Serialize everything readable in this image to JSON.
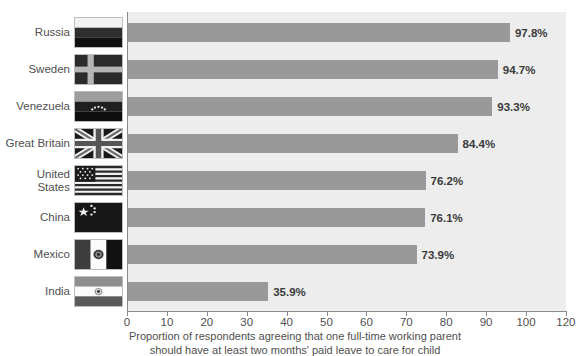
{
  "chart_data": {
    "type": "bar",
    "orientation": "horizontal",
    "title": "",
    "subtitle": "",
    "xlabel": "Proportion of respondents agreeing that one full-time working parent should have at least two months' paid leave to care for child",
    "ylabel": "",
    "categories": [
      "Russia",
      "Sweden",
      "Venezuela",
      "Great Britain",
      "United States",
      "China",
      "Mexico",
      "India"
    ],
    "values": [
      97.8,
      94.7,
      93.3,
      84.4,
      76.2,
      76.1,
      73.9,
      35.9
    ],
    "value_labels": [
      "97.8%",
      "94.7%",
      "93.3%",
      "84.4%",
      "76.2%",
      "76.1%",
      "73.9%",
      "35.9%"
    ],
    "xlim": [
      0,
      120
    ],
    "xticks": [
      0,
      10,
      20,
      30,
      40,
      50,
      60,
      70,
      80,
      90,
      100,
      120
    ],
    "xtick_labels": [
      "0",
      "10",
      "20",
      "30",
      "40",
      "50",
      "60",
      "70",
      "80",
      "90",
      "100",
      "120"
    ],
    "grid": false,
    "legend": null,
    "bar_color": "#999999",
    "plot_background": "#ededed",
    "value_label_color": "#3a3a3a"
  },
  "axis_caption": {
    "line1": "Proportion of respondents agreeing that one full-time working parent",
    "line2": "should have at least two months' paid leave to care for child"
  },
  "rows": [
    {
      "label": "Russia",
      "flag_icon": "flag-russia-icon",
      "value": 97.8,
      "value_label": "97.8%"
    },
    {
      "label": "Sweden",
      "flag_icon": "flag-sweden-icon",
      "value": 94.7,
      "value_label": "94.7%"
    },
    {
      "label": "Venezuela",
      "flag_icon": "flag-venezuela-icon",
      "value": 93.3,
      "value_label": "93.3%"
    },
    {
      "label": "Great Britain",
      "flag_icon": "flag-great-britain-icon",
      "value": 84.4,
      "value_label": "84.4%"
    },
    {
      "label": "United\nStates",
      "flag_icon": "flag-united-states-icon",
      "value": 76.2,
      "value_label": "76.2%"
    },
    {
      "label": "China",
      "flag_icon": "flag-china-icon",
      "value": 76.1,
      "value_label": "76.1%"
    },
    {
      "label": "Mexico",
      "flag_icon": "flag-mexico-icon",
      "value": 73.9,
      "value_label": "73.9%"
    },
    {
      "label": "India",
      "flag_icon": "flag-india-icon",
      "value": 35.9,
      "value_label": "35.9%"
    }
  ],
  "colors": {
    "bar": "#999999",
    "plot_bg": "#ededed",
    "text": "#4f4f4f",
    "axis": "#8a8a8a"
  }
}
